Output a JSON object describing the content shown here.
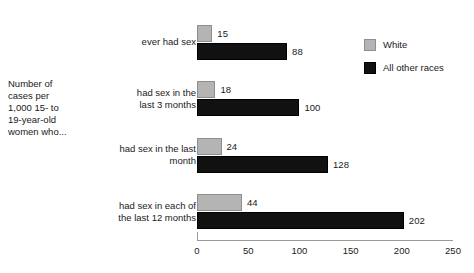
{
  "chart_data": {
    "type": "bar",
    "orientation": "horizontal",
    "title": "",
    "xlabel": "",
    "ylabel": "Number of cases per 1,000 15- to 19-year-old women who...",
    "categories": [
      "ever had sex",
      "had sex in the last 3 months",
      "had sex in the last month",
      "had sex in each of the last 12 months"
    ],
    "series": [
      {
        "name": "White",
        "color": "#b4b4b4",
        "values": [
          15,
          18,
          24,
          44
        ]
      },
      {
        "name": "All other races",
        "color": "#111111",
        "values": [
          88,
          100,
          128,
          202
        ]
      }
    ],
    "xlim": [
      0,
      250
    ],
    "xticks": [
      0,
      50,
      100,
      150,
      200,
      250
    ],
    "xtick_labels": [
      "0",
      "50",
      "100",
      "150",
      "200",
      "250"
    ],
    "grid": false,
    "legend_position": "top-right",
    "data_labels": true
  },
  "axis_caption": {
    "lines": [
      "Number of",
      "cases per",
      "1,000 15- to",
      "19-year-old",
      "women who..."
    ]
  },
  "categories_wrapped": [
    {
      "lines": [
        "ever had sex"
      ]
    },
    {
      "lines": [
        "had sex in the",
        "last 3 months"
      ]
    },
    {
      "lines": [
        "had sex in the last",
        "month"
      ]
    },
    {
      "lines": [
        "had sex in each of",
        "the last 12 months"
      ]
    }
  ],
  "bars": [
    {
      "group": 0,
      "series": "White",
      "value": 15,
      "label": "15"
    },
    {
      "group": 0,
      "series": "All other races",
      "value": 88,
      "label": "88"
    },
    {
      "group": 1,
      "series": "White",
      "value": 18,
      "label": "18"
    },
    {
      "group": 1,
      "series": "All other races",
      "value": 100,
      "label": "100"
    },
    {
      "group": 2,
      "series": "White",
      "value": 24,
      "label": "24"
    },
    {
      "group": 2,
      "series": "All other races",
      "value": 128,
      "label": "128"
    },
    {
      "group": 3,
      "series": "White",
      "value": 44,
      "label": "44"
    },
    {
      "group": 3,
      "series": "All other races",
      "value": 202,
      "label": "202"
    }
  ],
  "legend": {
    "items": [
      {
        "label": "White",
        "swatch": "white-series"
      },
      {
        "label": "All other races",
        "swatch": "other-series"
      }
    ]
  },
  "xticks": [
    {
      "label": "0"
    },
    {
      "label": "50"
    },
    {
      "label": "100"
    },
    {
      "label": "150"
    },
    {
      "label": "200"
    },
    {
      "label": "250"
    }
  ]
}
